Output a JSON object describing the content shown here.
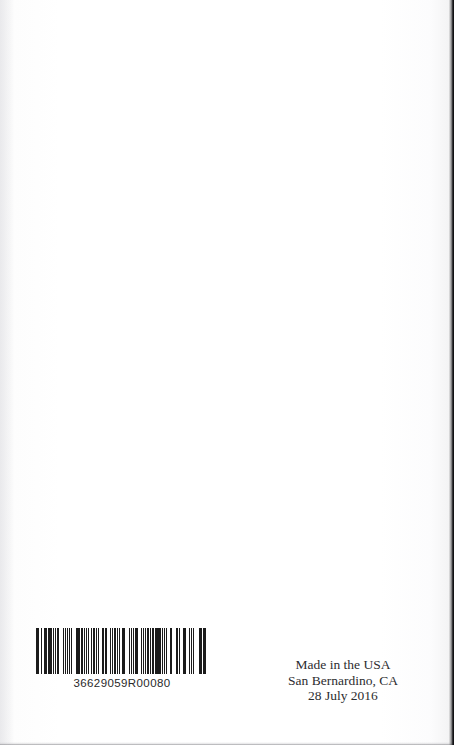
{
  "page": {
    "kind": "scanned-book-back-cover",
    "background_color": "#ffffff",
    "ink_color": "#2d2d2f",
    "width": 454,
    "height": 745
  },
  "barcode": {
    "label": "36629059R00080",
    "symbology_look": "code-128",
    "bar_color": "#1b1b1b",
    "module_widths": [
      2,
      1,
      1,
      2,
      1,
      3,
      1,
      1,
      2,
      1,
      1,
      1,
      3,
      2,
      1,
      1,
      1,
      2,
      2,
      1,
      1,
      3,
      1,
      2,
      1,
      1,
      2,
      1,
      1,
      1,
      2,
      3,
      1,
      1,
      2,
      1,
      2,
      1,
      3,
      1,
      1,
      2,
      1,
      1,
      2,
      2,
      1,
      1,
      3,
      1,
      1,
      2,
      1,
      1,
      1,
      2,
      3,
      1,
      2,
      1,
      1,
      2,
      1,
      1,
      2,
      1,
      3,
      1,
      1,
      1,
      2,
      2,
      1,
      1,
      2,
      1,
      1,
      3,
      1,
      2,
      1,
      1,
      2,
      1,
      2,
      1,
      1,
      3,
      2,
      1,
      1,
      1,
      2,
      1,
      3,
      1,
      1,
      2,
      2,
      1,
      1,
      1,
      3,
      1,
      2,
      1,
      1,
      2,
      1,
      1,
      2,
      3,
      1,
      1,
      1,
      2,
      1,
      2,
      3,
      1,
      1,
      2,
      1,
      1,
      2,
      1,
      1,
      3,
      2,
      1,
      1,
      1,
      2,
      2,
      1,
      3,
      1,
      1,
      2,
      1,
      1,
      1,
      2,
      1
    ]
  },
  "imprint": {
    "lines": [
      "Made in the USA",
      "San Bernardino, CA",
      "28 July 2016"
    ],
    "line_1": "Made in the USA",
    "line_2": "San Bernardino, CA",
    "line_3": "28 July 2016"
  }
}
